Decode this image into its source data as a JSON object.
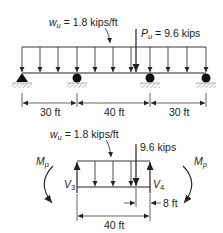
{
  "top_beam": {
    "load_label_symbol": "w",
    "load_label_sub": "u",
    "load_label_value": " = 1.8 kips/ft",
    "point_load_symbol": "P",
    "point_load_sub": "u",
    "point_load_value": " = 9.6 kips",
    "spans": [
      "30 ft",
      "40 ft",
      "30 ft"
    ]
  },
  "free_body": {
    "load_label_symbol": "w",
    "load_label_sub": "u",
    "load_label_value": " = 1.8 kips/ft",
    "point_load_label": "9.6 kips",
    "left_moment_symbol": "M",
    "left_moment_sub": "p",
    "right_moment_symbol": "M",
    "right_moment_sub": "p",
    "left_shear_symbol": "V",
    "left_shear_sub": "3",
    "right_shear_symbol": "V",
    "right_shear_sub": "4",
    "offset_dim": "8 ft",
    "length_dim": "40 ft"
  },
  "colors": {
    "line": "#222222",
    "hatch": "#888888"
  }
}
